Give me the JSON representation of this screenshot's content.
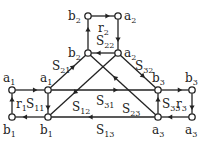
{
  "diagram": {
    "type": "signal-flow-graph",
    "nodes": [
      {
        "id": "a1_out",
        "label": "a",
        "sub": "1",
        "x": 12,
        "y": 90,
        "lx": 3,
        "ly": 82
      },
      {
        "id": "b1_out",
        "label": "b",
        "sub": "1",
        "x": 12,
        "y": 117,
        "lx": 3,
        "ly": 134
      },
      {
        "id": "a1",
        "label": "a",
        "sub": "1",
        "x": 48,
        "y": 90,
        "lx": 40,
        "ly": 82
      },
      {
        "id": "b1",
        "label": "b",
        "sub": "1",
        "x": 48,
        "y": 117,
        "lx": 40,
        "ly": 134
      },
      {
        "id": "b2_top",
        "label": "b",
        "sub": "2",
        "x": 88,
        "y": 16,
        "lx": 68,
        "ly": 20
      },
      {
        "id": "a2_top",
        "label": "a",
        "sub": "2",
        "x": 118,
        "y": 16,
        "lx": 124,
        "ly": 20
      },
      {
        "id": "b2",
        "label": "b",
        "sub": "2",
        "x": 88,
        "y": 53,
        "lx": 68,
        "ly": 57
      },
      {
        "id": "a2",
        "label": "a",
        "sub": "2",
        "x": 118,
        "y": 53,
        "lx": 124,
        "ly": 57
      },
      {
        "id": "b3",
        "label": "b",
        "sub": "3",
        "x": 158,
        "y": 90,
        "lx": 152,
        "ly": 82
      },
      {
        "id": "a3",
        "label": "a",
        "sub": "3",
        "x": 158,
        "y": 117,
        "lx": 152,
        "ly": 134
      },
      {
        "id": "b3_out",
        "label": "b",
        "sub": "3",
        "x": 192,
        "y": 90,
        "lx": 185,
        "ly": 82
      },
      {
        "id": "a3_out",
        "label": "a",
        "sub": "3",
        "x": 192,
        "y": 117,
        "lx": 185,
        "ly": 134
      }
    ],
    "edges": [
      {
        "from": "a1_out",
        "to": "a1",
        "label": "",
        "sub": ""
      },
      {
        "from": "b1_out",
        "to": "a1_out",
        "label": "r",
        "sub": "1",
        "lx": 16,
        "ly": 108
      },
      {
        "from": "b1",
        "to": "b1_out",
        "label": "",
        "sub": ""
      },
      {
        "from": "a1",
        "to": "b1",
        "label": "S",
        "sub": "11",
        "lx": 26,
        "ly": 108
      },
      {
        "from": "a1",
        "to": "b2",
        "label": "S",
        "sub": "21",
        "lx": 52,
        "ly": 70
      },
      {
        "from": "a1",
        "to": "b3",
        "label": "S",
        "sub": "31",
        "lx": 96,
        "ly": 105
      },
      {
        "from": "a2",
        "to": "b1",
        "label": "S",
        "sub": "12",
        "lx": 72,
        "ly": 111
      },
      {
        "from": "a2",
        "to": "b2",
        "label": "S",
        "sub": "22",
        "lx": 96,
        "ly": 45
      },
      {
        "from": "a2",
        "to": "b3",
        "label": "S",
        "sub": "32",
        "lx": 135,
        "ly": 70
      },
      {
        "from": "b2",
        "to": "b2_top",
        "label": "",
        "sub": ""
      },
      {
        "from": "b2_top",
        "to": "a2_top",
        "label": "r",
        "sub": "2",
        "lx": 98,
        "ly": 32
      },
      {
        "from": "a2_top",
        "to": "a2",
        "label": "",
        "sub": ""
      },
      {
        "from": "a3",
        "to": "b2",
        "label": "S",
        "sub": "23",
        "lx": 122,
        "ly": 113
      },
      {
        "from": "a3",
        "to": "b1",
        "label": "S",
        "sub": "13",
        "lx": 96,
        "ly": 134
      },
      {
        "from": "a3",
        "to": "b3",
        "label": "S",
        "sub": "33",
        "lx": 162,
        "ly": 108
      },
      {
        "from": "b3",
        "to": "b3_out",
        "label": "",
        "sub": ""
      },
      {
        "from": "b3_out",
        "to": "a3_out",
        "label": "r",
        "sub": "3",
        "lx": 176,
        "ly": 108
      },
      {
        "from": "a3_out",
        "to": "a3",
        "label": "",
        "sub": ""
      }
    ]
  }
}
